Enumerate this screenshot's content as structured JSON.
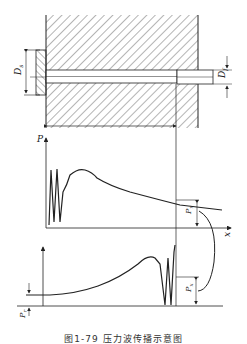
{
  "figure": {
    "caption": "图1-79  压力波传播示意图",
    "labels": {
      "nozzle_diameter": "D",
      "nozzle_diameter_sub": "s",
      "pipe_diameter": "D",
      "pipe_diameter_sub": "f",
      "pressure_axis": "P",
      "position_axis": "x",
      "upper_pressure": "P",
      "upper_pressure_sub": "x",
      "lower_pressure": "P",
      "lower_pressure_sub": "x",
      "residual_pressure": "P",
      "residual_pressure_sub": "r"
    },
    "colors": {
      "stroke": "#222222",
      "background": "#ffffff"
    }
  }
}
